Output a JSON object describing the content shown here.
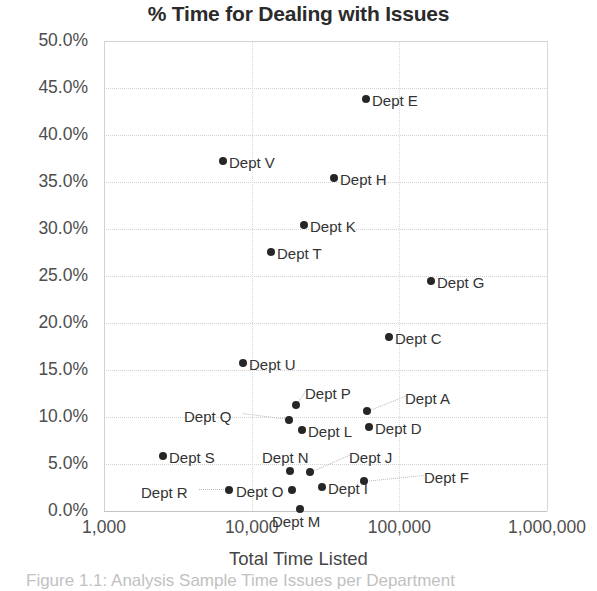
{
  "chart_data": {
    "type": "scatter",
    "title": "% Time for Dealing with Issues",
    "xlabel": "Total Time Listed",
    "ylabel": "",
    "xscale": "log",
    "xlim": [
      1000,
      1000000
    ],
    "ylim": [
      0,
      0.5
    ],
    "grid": true,
    "legend": "none",
    "xticks": [
      "1,000",
      "10,000",
      "100,000",
      "1,000,000"
    ],
    "xtick_values": [
      1000,
      10000,
      100000,
      1000000
    ],
    "yticks": [
      "0.0%",
      "5.0%",
      "10.0%",
      "15.0%",
      "20.0%",
      "25.0%",
      "30.0%",
      "35.0%",
      "40.0%",
      "45.0%",
      "50.0%"
    ],
    "ytick_values": [
      0,
      5,
      10,
      15,
      20,
      25,
      30,
      35,
      40,
      45,
      50
    ],
    "marker_color": "#262626",
    "points": [
      {
        "label": "Dept E",
        "x": 75000,
        "y": 44.5,
        "px": 366,
        "py": 99,
        "lx": 372,
        "ly": 92,
        "leader": false
      },
      {
        "label": "Dept V",
        "x": 7200,
        "y": 37.4,
        "px": 223,
        "py": 161,
        "lx": 229,
        "ly": 154,
        "leader": false
      },
      {
        "label": "Dept H",
        "x": 58000,
        "y": 35.8,
        "px": 334,
        "py": 178,
        "lx": 340,
        "ly": 171,
        "leader": false
      },
      {
        "label": "Dept K",
        "x": 28000,
        "y": 30.4,
        "px": 304,
        "py": 225,
        "lx": 310,
        "ly": 218,
        "leader": false
      },
      {
        "label": "Dept T",
        "x": 16500,
        "y": 27.6,
        "px": 271,
        "py": 252,
        "lx": 277,
        "ly": 245,
        "leader": false
      },
      {
        "label": "Dept G",
        "x": 220000,
        "y": 24.7,
        "px": 431,
        "py": 281,
        "lx": 437,
        "ly": 274,
        "leader": false
      },
      {
        "label": "Dept C",
        "x": 92000,
        "y": 18.4,
        "px": 389,
        "py": 337,
        "lx": 395,
        "ly": 330,
        "leader": false
      },
      {
        "label": "Dept U",
        "x": 11800,
        "y": 15.6,
        "px": 243,
        "py": 363,
        "lx": 249,
        "ly": 356,
        "leader": false
      },
      {
        "label": "Dept P",
        "x": 24000,
        "y": 11.1,
        "px": 296,
        "py": 405,
        "lx": 305,
        "ly": 385,
        "leader": true
      },
      {
        "label": "Dept A",
        "x": 76000,
        "y": 10.4,
        "px": 367,
        "py": 411,
        "lx": 405,
        "ly": 390,
        "leader": true
      },
      {
        "label": "Dept Q",
        "x": 21500,
        "y": 9.4,
        "px": 289,
        "py": 420,
        "lx": 184,
        "ly": 408,
        "leader": true
      },
      {
        "label": "Dept D",
        "x": 79000,
        "y": 8.7,
        "px": 369,
        "py": 427,
        "lx": 375,
        "ly": 420,
        "leader": false
      },
      {
        "label": "Dept L",
        "x": 26500,
        "y": 8.4,
        "px": 302,
        "py": 430,
        "lx": 308,
        "ly": 423,
        "leader": false
      },
      {
        "label": "Dept S",
        "x": 2650,
        "y": 5.8,
        "px": 163,
        "py": 456,
        "lx": 169,
        "ly": 449,
        "leader": false
      },
      {
        "label": "Dept N",
        "x": 22500,
        "y": 4.2,
        "px": 290,
        "py": 471,
        "lx": 262,
        "ly": 449,
        "leader": false
      },
      {
        "label": "Dept J",
        "x": 34000,
        "y": 4.1,
        "px": 310,
        "py": 472,
        "lx": 349,
        "ly": 449,
        "leader": true
      },
      {
        "label": "Dept F",
        "x": 90000,
        "y": 3.1,
        "px": 364,
        "py": 481,
        "lx": 424,
        "ly": 469,
        "leader": true
      },
      {
        "label": "Dept R",
        "x": 13800,
        "y": 2.2,
        "px": 229,
        "py": 490,
        "lx": 141,
        "ly": 484,
        "leader": true
      },
      {
        "label": "Dept O",
        "x": 23000,
        "y": 2.2,
        "px": 292,
        "py": 490,
        "lx": 236,
        "ly": 483,
        "leader": false
      },
      {
        "label": "Dept I",
        "x": 30500,
        "y": 2.5,
        "px": 322,
        "py": 487,
        "lx": 328,
        "ly": 480,
        "leader": false
      },
      {
        "label": "Dept M",
        "x": 25500,
        "y": 0.2,
        "px": 300,
        "py": 509,
        "lx": 272,
        "ly": 513,
        "leader": false
      }
    ]
  },
  "caption": {
    "text": "Figure 1.1: Analysis Sample Time Issues per Department"
  }
}
